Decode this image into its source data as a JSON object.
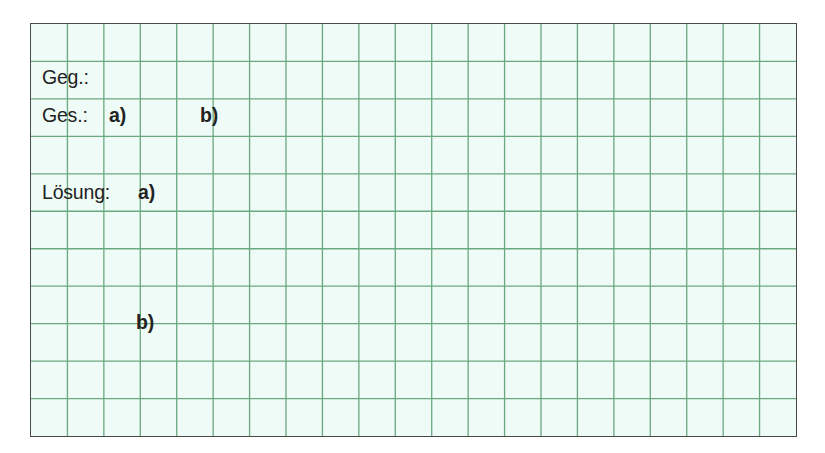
{
  "worksheet": {
    "grid": {
      "columns": 21,
      "rows": 11,
      "line_color": "#6aa980",
      "background_color": "#effbf6",
      "border_color": "#4a4a4a"
    },
    "given_label": "Geg.:",
    "sought_label": "Ges.:",
    "sought_part_a": "a)",
    "sought_part_b": "b)",
    "solution_label": "Lösung:",
    "solution_part_a": "a)",
    "solution_part_b": "b)"
  }
}
